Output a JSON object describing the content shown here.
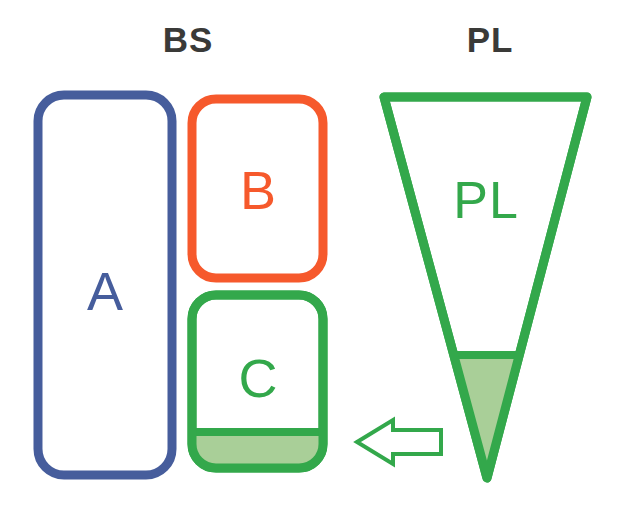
{
  "figure": {
    "type": "diagram",
    "background_color": "#ffffff"
  },
  "headers": [
    {
      "id": "bs",
      "label": "BS",
      "x": 188,
      "y": 40,
      "color": "#3a3a38"
    },
    {
      "id": "pl",
      "label": "PL",
      "x": 490,
      "y": 40,
      "color": "#3a3a38"
    }
  ],
  "colors": {
    "blue": "#465d9c",
    "orange": "#f6592c",
    "green": "#33a84b",
    "green_fill": "#a9cf98",
    "text_dark": "#3a3a38",
    "white": "#ffffff"
  },
  "bs_group": {
    "name": "BS",
    "boxes": [
      {
        "id": "a",
        "label": "A",
        "stroke": "#465d9c",
        "fill": "#ffffff",
        "x": 38,
        "y": 95,
        "width": 134,
        "height": 380,
        "radius": 26,
        "stroke_width": 9,
        "label_x": 105,
        "label_y": 291,
        "label_color": "#465d9c",
        "filled_fraction": 0
      },
      {
        "id": "b",
        "label": "B",
        "stroke": "#f6592c",
        "fill": "#ffffff",
        "x": 192,
        "y": 99,
        "width": 131,
        "height": 179,
        "radius": 24,
        "stroke_width": 9,
        "label_x": 258,
        "label_y": 190,
        "label_color": "#f6592c",
        "filled_fraction": 0
      },
      {
        "id": "c",
        "label": "C",
        "stroke": "#33a84b",
        "fill": "#ffffff",
        "x": 192,
        "y": 295,
        "width": 131,
        "height": 173,
        "radius": 24,
        "stroke_width": 9,
        "label_x": 258,
        "label_y": 378,
        "label_color": "#33a84b",
        "fill_color": "#a9cf98",
        "fill_top_y": 432,
        "fill_line_width": 8,
        "filled_fraction": 0.21
      }
    ]
  },
  "pl_group": {
    "name": "PL",
    "triangle": {
      "id": "pl-triangle",
      "label": "PL",
      "stroke": "#33a84b",
      "fill": "#ffffff",
      "stroke_width": 9,
      "apex_x": 487,
      "apex_y": 478,
      "top_left_x": 384,
      "top_right_x": 587,
      "top_y": 97,
      "label_x": 486,
      "label_y": 200,
      "label_color": "#33a84b",
      "fill_color": "#a9cf98",
      "fill_top_y": 355,
      "fill_line_width": 8,
      "filled_fraction": 0.32
    }
  },
  "arrow": {
    "id": "transfer-arrow",
    "direction": "left",
    "stroke": "#33a84b",
    "fill": "#ffffff",
    "stroke_width": 4,
    "tip_x": 357,
    "tail_x": 441,
    "center_y": 442,
    "shaft_half_height": 12,
    "head_half_height": 22,
    "head_width": 36
  }
}
